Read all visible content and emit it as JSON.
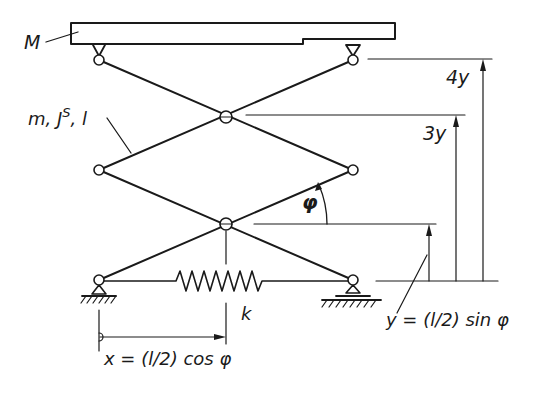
{
  "diagram": {
    "type": "scissor-lift mechanism",
    "labels": {
      "mass_platform": "M",
      "link_properties": "m, J",
      "link_properties_sup": "S",
      "link_properties_tail": ", l",
      "spring": "k",
      "angle": "φ",
      "height_4y": "4y",
      "height_3y": "3y",
      "y_formula": "y = (l/2) sin φ",
      "x_formula": "x = (l/2) cos φ"
    },
    "colors": {
      "ink": "#1a1a1a",
      "background": "#ffffff"
    }
  }
}
